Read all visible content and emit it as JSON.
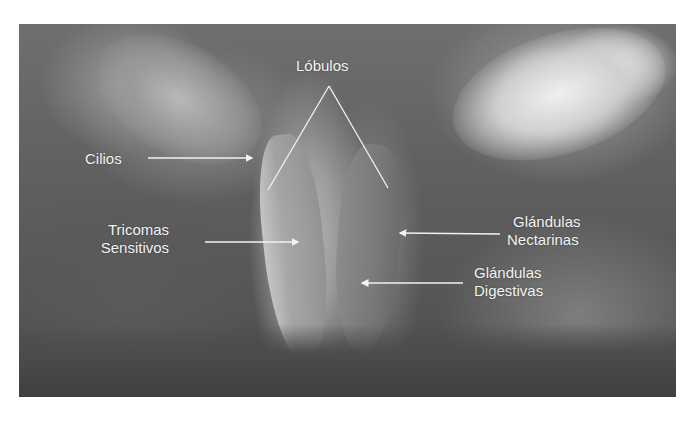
{
  "figure": {
    "background_color": "#ffffff",
    "photo_tone": "grayscale",
    "label_color": "#f2f2f2",
    "line_color": "#f2f2f2"
  },
  "labels": {
    "lobulos": "Lóbulos",
    "cilios": "Cilios",
    "tricomas_line1": "Tricomas",
    "tricomas_line2": "Sensitivos",
    "nectarinas_line1": "Glándulas",
    "nectarinas_line2": "Nectarinas",
    "digestivas_line1": "Glándulas",
    "digestivas_line2": "Digestivas"
  }
}
